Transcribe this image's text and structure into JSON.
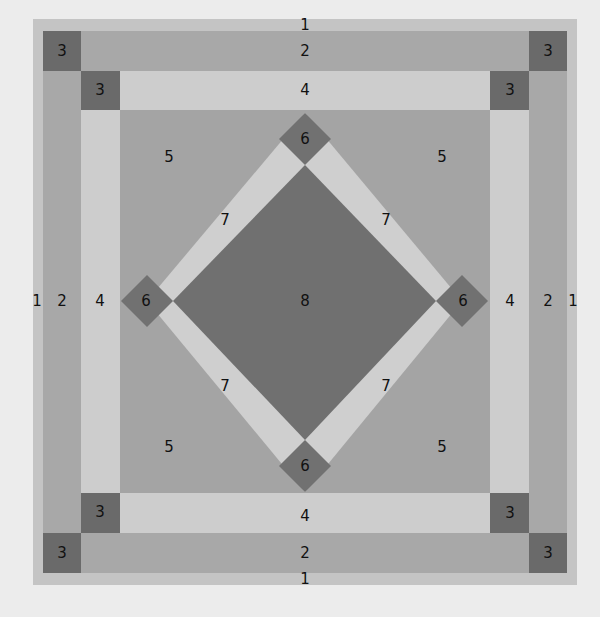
{
  "diagram": {
    "type": "quilt-block-layout",
    "colors": {
      "background": "#ececec",
      "1": "#c4c4c4",
      "2": "#a8a8a8",
      "3": "#6a6a6a",
      "4": "#cdcdcd",
      "5": "#a4a4a4",
      "6": "#717171",
      "7": "#cfcfcf",
      "8": "#707070"
    },
    "labels": {
      "border1_top": "1",
      "border1_bottom": "1",
      "border1_left": "1",
      "border1_right": "1",
      "border2_top": "2",
      "border2_bottom": "2",
      "border2_left": "2",
      "border2_right": "2",
      "corner3_outer_tl": "3",
      "corner3_outer_tr": "3",
      "corner3_outer_bl": "3",
      "corner3_outer_br": "3",
      "corner3_inner_tl": "3",
      "corner3_inner_tr": "3",
      "corner3_inner_bl": "3",
      "corner3_inner_br": "3",
      "border4_top": "4",
      "border4_bottom": "4",
      "border4_left": "4",
      "border4_right": "4",
      "field5_tl": "5",
      "field5_tr": "5",
      "field5_bl": "5",
      "field5_br": "5",
      "diamond6_top": "6",
      "diamond6_left": "6",
      "diamond6_right": "6",
      "diamond6_bottom": "6",
      "sash7_tl": "7",
      "sash7_tr": "7",
      "sash7_bl": "7",
      "sash7_br": "7",
      "center8": "8"
    }
  }
}
